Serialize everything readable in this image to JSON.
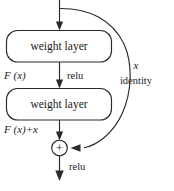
{
  "figure": {
    "name": "residual-learning-building-block",
    "width": 174,
    "height": 191,
    "background_color": "#ffffff",
    "stroke_color": "#2a2a2a",
    "text_color": "#1a1a1a"
  },
  "blocks": [
    {
      "id": "weight-layer-1",
      "label": "weight layer"
    },
    {
      "id": "weight-layer-2",
      "label": "weight layer"
    }
  ],
  "operator": {
    "id": "addition-node",
    "symbol": "+"
  },
  "labels": {
    "f_of_x": {
      "italic": "F",
      "roman_open": " (",
      "italic_var": "x",
      "roman_close": ")",
      "full": "F (x)"
    },
    "f_of_x_plus_x": {
      "full": "F (x)+x",
      "italic": "F",
      "roman_open": " (",
      "italic_var": "x",
      "roman_close": ")+",
      "italic_var2": "x"
    },
    "relu_mid": "relu",
    "relu_bottom": "relu",
    "shortcut_var": "x",
    "shortcut_name": "identity"
  },
  "edges": [
    {
      "id": "input-to-block1",
      "from": "input",
      "to": "weight-layer-1",
      "arrow": true
    },
    {
      "id": "block1-to-block2",
      "from": "weight-layer-1",
      "to": "weight-layer-2",
      "arrow": true,
      "label": "relu"
    },
    {
      "id": "block2-to-adder",
      "from": "weight-layer-2",
      "to": "addition-node",
      "arrow": true
    },
    {
      "id": "shortcut-identity",
      "from": "input",
      "to": "addition-node",
      "arrow": true,
      "curved": true,
      "label": "identity"
    },
    {
      "id": "adder-to-output",
      "from": "addition-node",
      "to": "output",
      "arrow": true,
      "label": "relu"
    }
  ]
}
